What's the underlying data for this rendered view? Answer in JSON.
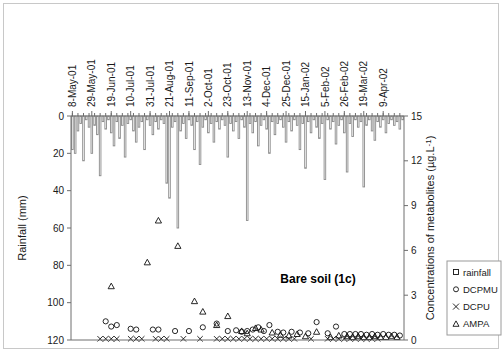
{
  "figure": {
    "panel_label": "Bare soil (1c)",
    "border_color": "#c8c8c8",
    "axis_color": "#6e6e6e",
    "bar_stroke": "#8a8a8a",
    "marker_color": "#111111"
  },
  "axes": {
    "left": {
      "title": "Rainfall (mm)",
      "ticks": [
        0,
        20,
        40,
        60,
        80,
        100,
        120
      ],
      "min": 0,
      "max": 120,
      "inverted": true
    },
    "right": {
      "title": "Concentrations of metabolites (µg.L-1)",
      "title_display": "Concentrations of metabolites (µg.L",
      "title_sup": "-1",
      "title_tail": ")",
      "ticks": [
        0,
        3,
        6,
        9,
        12,
        15
      ],
      "min": 0,
      "max": 15
    },
    "bottom": {
      "tick_labels": [
        "8-May-01",
        "29-May-01",
        "19-Jun-01",
        "10-Jul-01",
        "31-Jul-01",
        "21-Aug-01",
        "11-Sep-01",
        "2-Oct-01",
        "23-Oct-01",
        "13-Nov-01",
        "4-Dec-01",
        "25-Dec-01",
        "15-Jan-02",
        "5-Feb-02",
        "26-Feb-02",
        "19-Mar-02",
        "9-Apr-02"
      ],
      "label_rotation": -90
    }
  },
  "legend": {
    "position": "right-lower",
    "entries": [
      {
        "label": "rainfall",
        "marker": "square"
      },
      {
        "label": "DCPMU",
        "marker": "circle"
      },
      {
        "label": "DCPU",
        "marker": "cross"
      },
      {
        "label": "AMPA",
        "marker": "triangle"
      }
    ]
  },
  "chart_data": {
    "type": "bar",
    "title": "Bare soil (1c)",
    "xlabel": "",
    "ylabel": "Rainfall (mm)",
    "y2label": "Concentrations of metabolites (µg.L-1)",
    "ylim": [
      0,
      120
    ],
    "y2lim": [
      0,
      15
    ],
    "y_inverted": true,
    "grid": false,
    "legend_position": "right",
    "x_tick_labels": [
      "8-May-01",
      "29-May-01",
      "19-Jun-01",
      "10-Jul-01",
      "31-Jul-01",
      "21-Aug-01",
      "11-Sep-01",
      "2-Oct-01",
      "23-Oct-01",
      "13-Nov-01",
      "4-Dec-01",
      "25-Dec-01",
      "15-Jan-02",
      "5-Feb-02",
      "26-Feb-02",
      "19-Mar-02",
      "9-Apr-02"
    ],
    "x_tick_index": [
      0,
      7,
      14,
      21,
      28,
      35,
      42,
      49,
      56,
      63,
      70,
      77,
      84,
      91,
      98,
      105,
      112
    ],
    "n_points": 120,
    "series": [
      {
        "name": "rainfall",
        "type": "bar",
        "axis": "left",
        "unit": "mm",
        "values": [
          18,
          20,
          8,
          4,
          24,
          2,
          6,
          20,
          5,
          10,
          32,
          3,
          7,
          2,
          9,
          16,
          3,
          12,
          5,
          22,
          4,
          2,
          8,
          14,
          6,
          3,
          18,
          2,
          5,
          10,
          3,
          7,
          2,
          4,
          36,
          44,
          6,
          3,
          60,
          8,
          4,
          12,
          2,
          5,
          18,
          3,
          26,
          6,
          2,
          9,
          4,
          14,
          3,
          7,
          2,
          5,
          22,
          4,
          8,
          3,
          12,
          2,
          6,
          56,
          4,
          9,
          3,
          16,
          5,
          2,
          7,
          20,
          3,
          10,
          4,
          2,
          6,
          14,
          3,
          8,
          2,
          5,
          18,
          4,
          28,
          3,
          9,
          2,
          6,
          12,
          4,
          34,
          2,
          7,
          3,
          15,
          5,
          2,
          9,
          30,
          4,
          11,
          2,
          6,
          3,
          38,
          5,
          2,
          8,
          13,
          3,
          6,
          2,
          9,
          4,
          2,
          5,
          3,
          7,
          2
        ]
      },
      {
        "name": "AMPA",
        "type": "scatter",
        "axis": "right",
        "marker": "triangle",
        "unit": "µg.L-1",
        "points": [
          {
            "i": 14,
            "v": 3.6
          },
          {
            "i": 27,
            "v": 5.2
          },
          {
            "i": 31,
            "v": 8.0
          },
          {
            "i": 38,
            "v": 6.3
          },
          {
            "i": 44,
            "v": 2.6
          },
          {
            "i": 47,
            "v": 1.9
          },
          {
            "i": 52,
            "v": 1.0
          },
          {
            "i": 56,
            "v": 1.6
          },
          {
            "i": 61,
            "v": 0.6
          },
          {
            "i": 63,
            "v": 0.45
          },
          {
            "i": 66,
            "v": 0.8
          },
          {
            "i": 68,
            "v": 0.7
          },
          {
            "i": 72,
            "v": 0.5
          },
          {
            "i": 75,
            "v": 0.35
          },
          {
            "i": 78,
            "v": 0.3
          },
          {
            "i": 81,
            "v": 0.4
          },
          {
            "i": 84,
            "v": 0.25
          },
          {
            "i": 88,
            "v": 0.55
          },
          {
            "i": 93,
            "v": 0.2
          },
          {
            "i": 96,
            "v": 0.3
          },
          {
            "i": 99,
            "v": 0.25
          },
          {
            "i": 101,
            "v": 0.2
          },
          {
            "i": 103,
            "v": 0.25
          },
          {
            "i": 105,
            "v": 0.2
          },
          {
            "i": 107,
            "v": 0.2
          },
          {
            "i": 109,
            "v": 0.25
          },
          {
            "i": 111,
            "v": 0.2
          },
          {
            "i": 113,
            "v": 0.2
          },
          {
            "i": 115,
            "v": 0.25
          },
          {
            "i": 117,
            "v": 0.2
          }
        ]
      },
      {
        "name": "DCPMU",
        "type": "scatter",
        "axis": "right",
        "marker": "circle",
        "unit": "µg.L-1",
        "points": [
          {
            "i": 12,
            "v": 1.25
          },
          {
            "i": 14,
            "v": 0.9
          },
          {
            "i": 16,
            "v": 1.0
          },
          {
            "i": 21,
            "v": 0.75
          },
          {
            "i": 23,
            "v": 0.7
          },
          {
            "i": 29,
            "v": 0.7
          },
          {
            "i": 31,
            "v": 0.7
          },
          {
            "i": 37,
            "v": 0.6
          },
          {
            "i": 42,
            "v": 0.6
          },
          {
            "i": 47,
            "v": 0.85
          },
          {
            "i": 52,
            "v": 1.1
          },
          {
            "i": 56,
            "v": 0.6
          },
          {
            "i": 59,
            "v": 0.65
          },
          {
            "i": 61,
            "v": 0.55
          },
          {
            "i": 63,
            "v": 0.6
          },
          {
            "i": 65,
            "v": 0.7
          },
          {
            "i": 67,
            "v": 0.85
          },
          {
            "i": 69,
            "v": 0.6
          },
          {
            "i": 71,
            "v": 1.0
          },
          {
            "i": 74,
            "v": 0.55
          },
          {
            "i": 76,
            "v": 0.5
          },
          {
            "i": 79,
            "v": 0.55
          },
          {
            "i": 82,
            "v": 0.5
          },
          {
            "i": 85,
            "v": 0.45
          },
          {
            "i": 88,
            "v": 1.2
          },
          {
            "i": 92,
            "v": 0.45
          },
          {
            "i": 95,
            "v": 0.9
          },
          {
            "i": 98,
            "v": 0.4
          },
          {
            "i": 100,
            "v": 0.4
          },
          {
            "i": 102,
            "v": 0.4
          },
          {
            "i": 104,
            "v": 0.4
          },
          {
            "i": 106,
            "v": 0.35
          },
          {
            "i": 108,
            "v": 0.4
          },
          {
            "i": 110,
            "v": 0.35
          },
          {
            "i": 112,
            "v": 0.4
          },
          {
            "i": 114,
            "v": 0.35
          },
          {
            "i": 116,
            "v": 0.35
          },
          {
            "i": 118,
            "v": 0.3
          }
        ]
      },
      {
        "name": "DCPU",
        "type": "scatter",
        "axis": "right",
        "marker": "cross",
        "unit": "µg.L-1",
        "points": [
          {
            "i": 10,
            "v": 0.08
          },
          {
            "i": 12,
            "v": 0.08
          },
          {
            "i": 14,
            "v": 0.08
          },
          {
            "i": 16,
            "v": 0.08
          },
          {
            "i": 21,
            "v": 0.08
          },
          {
            "i": 23,
            "v": 0.08
          },
          {
            "i": 25,
            "v": 0.08
          },
          {
            "i": 30,
            "v": 0.08
          },
          {
            "i": 32,
            "v": 0.08
          },
          {
            "i": 34,
            "v": 0.08
          },
          {
            "i": 40,
            "v": 0.08
          },
          {
            "i": 46,
            "v": 0.08
          },
          {
            "i": 52,
            "v": 0.08
          },
          {
            "i": 54,
            "v": 0.08
          },
          {
            "i": 56,
            "v": 0.08
          },
          {
            "i": 58,
            "v": 0.08
          },
          {
            "i": 60,
            "v": 0.08
          },
          {
            "i": 62,
            "v": 0.08
          },
          {
            "i": 64,
            "v": 0.08
          },
          {
            "i": 66,
            "v": 0.08
          },
          {
            "i": 68,
            "v": 0.08
          },
          {
            "i": 70,
            "v": 0.08
          },
          {
            "i": 72,
            "v": 0.08
          },
          {
            "i": 74,
            "v": 0.08
          },
          {
            "i": 76,
            "v": 0.08
          },
          {
            "i": 78,
            "v": 0.08
          },
          {
            "i": 80,
            "v": 0.08
          },
          {
            "i": 86,
            "v": 0.08
          },
          {
            "i": 92,
            "v": 0.08
          },
          {
            "i": 94,
            "v": 0.08
          },
          {
            "i": 96,
            "v": 0.08
          },
          {
            "i": 98,
            "v": 0.08
          },
          {
            "i": 100,
            "v": 0.08
          },
          {
            "i": 102,
            "v": 0.08
          },
          {
            "i": 104,
            "v": 0.08
          },
          {
            "i": 106,
            "v": 0.08
          },
          {
            "i": 108,
            "v": 0.08
          },
          {
            "i": 110,
            "v": 0.08
          }
        ]
      }
    ]
  }
}
